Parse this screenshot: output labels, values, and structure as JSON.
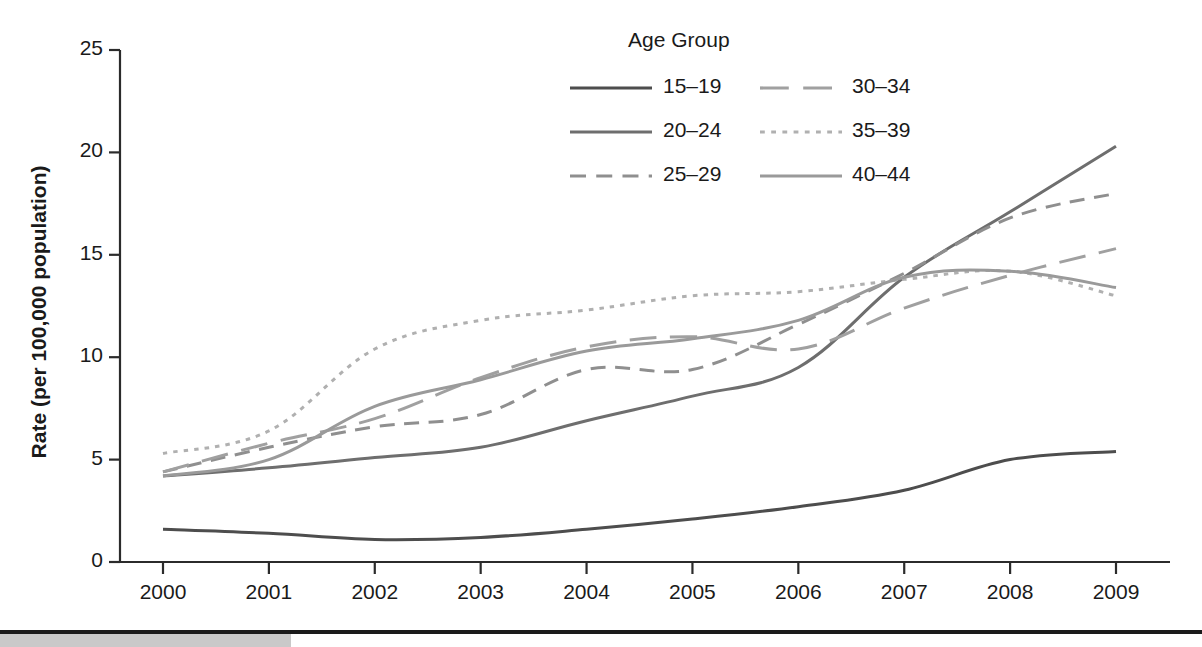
{
  "chart_data": {
    "type": "line",
    "title": "",
    "xlabel": "",
    "ylabel": "Rate (per 100,000 population)",
    "x": [
      2000,
      2001,
      2002,
      2003,
      2004,
      2005,
      2006,
      2007,
      2008,
      2009
    ],
    "xtick_labels": [
      "2000",
      "2001",
      "2002",
      "2003",
      "2004",
      "2005",
      "2006",
      "2007",
      "2008",
      "2009"
    ],
    "ytick_labels": [
      "0",
      "5",
      "10",
      "15",
      "20",
      "25"
    ],
    "ytick_values": [
      0,
      5,
      10,
      15,
      20,
      25
    ],
    "ylim": [
      0,
      25
    ],
    "xlim": [
      2000,
      2009
    ],
    "grid": false,
    "legend_title": "Age Group",
    "legend_position": "top-right",
    "series": [
      {
        "name": "15–19",
        "values": [
          1.6,
          1.4,
          1.1,
          1.2,
          1.6,
          2.1,
          2.7,
          3.5,
          5.0,
          5.4
        ],
        "style": "solid",
        "color": "#4d4d4d",
        "width": 3.0
      },
      {
        "name": "20–24",
        "values": [
          4.2,
          4.6,
          5.1,
          5.6,
          6.9,
          8.1,
          9.5,
          13.9,
          17.1,
          20.3
        ],
        "style": "solid",
        "color": "#6e6e6e",
        "width": 3.0
      },
      {
        "name": "25–29",
        "values": [
          4.4,
          5.6,
          6.6,
          7.2,
          9.4,
          9.4,
          11.6,
          14.1,
          16.8,
          18.0
        ],
        "style": "dashed",
        "color": "#8f8f8f",
        "width": 3.0
      },
      {
        "name": "30–34",
        "values": [
          4.4,
          5.8,
          7.0,
          9.0,
          10.5,
          11.0,
          10.4,
          12.4,
          14.0,
          15.3
        ],
        "style": "longdash",
        "color": "#a0a0a0",
        "width": 3.0
      },
      {
        "name": "35–39",
        "values": [
          5.3,
          6.4,
          10.4,
          11.8,
          12.3,
          13.0,
          13.2,
          13.8,
          14.2,
          13.0
        ],
        "style": "dotted",
        "color": "#b0b0b0",
        "width": 3.0
      },
      {
        "name": "40–44",
        "values": [
          4.2,
          5.0,
          7.6,
          8.9,
          10.3,
          10.9,
          11.8,
          13.9,
          14.2,
          13.4
        ],
        "style": "solid",
        "color": "#9a9a9a",
        "width": 3.0
      }
    ]
  },
  "legend": {
    "title": "Age Group",
    "entries": [
      {
        "label": "15–19",
        "style": "solid",
        "color": "#4d4d4d"
      },
      {
        "label": "20–24",
        "style": "solid",
        "color": "#6e6e6e"
      },
      {
        "label": "25–29",
        "style": "dashed",
        "color": "#8f8f8f"
      },
      {
        "label": "30–34",
        "style": "longdash",
        "color": "#a0a0a0"
      },
      {
        "label": "35–39",
        "style": "dotted",
        "color": "#b0b0b0"
      },
      {
        "label": "40–44",
        "style": "solid",
        "color": "#9a9a9a"
      }
    ]
  },
  "axes": {
    "y_title": "Rate (per 100,000 population)",
    "y_ticks": [
      "25",
      "20",
      "15",
      "10",
      "5",
      "0"
    ],
    "x_ticks": [
      "2000",
      "2001",
      "2002",
      "2003",
      "2004",
      "2005",
      "2006",
      "2007",
      "2008",
      "2009"
    ],
    "axis_color": "#2b2b2b"
  },
  "footer": {
    "rule_color": "#1b1b1b",
    "bar_color": "#c9c9c9"
  }
}
